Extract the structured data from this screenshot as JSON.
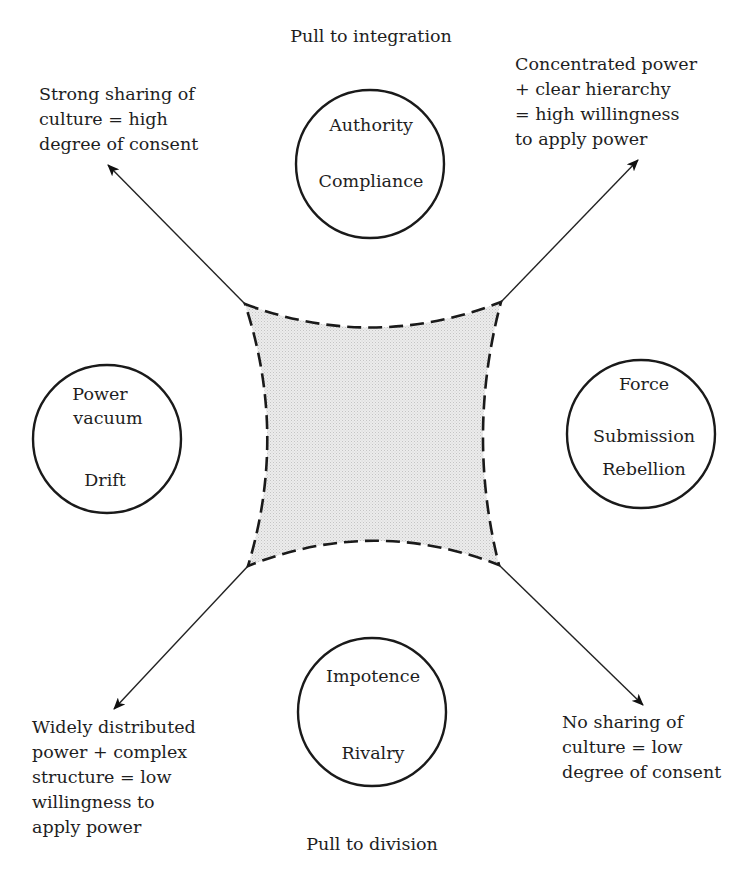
{
  "poles": {
    "top": "Pull to integration",
    "bottom": "Pull to division"
  },
  "circles": {
    "top": {
      "lines": [
        "Authority",
        "Compliance"
      ]
    },
    "left": {
      "lines": [
        "Power",
        "vacuum",
        "Drift"
      ]
    },
    "right": {
      "lines": [
        "Force",
        "Submission",
        "Rebellion"
      ]
    },
    "bottom": {
      "lines": [
        "Impotence",
        "Rivalry"
      ]
    }
  },
  "corner_labels": {
    "top_left": [
      "Strong sharing of",
      "culture = high",
      "degree of consent"
    ],
    "top_right": [
      "Concentrated power",
      "+ clear hierarchy",
      "= high willingness",
      "to apply power"
    ],
    "bottom_left": [
      "Widely distributed",
      "power + complex",
      "structure = low",
      "willingness to",
      "apply power"
    ],
    "bottom_right": [
      "No sharing of",
      "culture = low",
      "degree of consent"
    ]
  },
  "colors": {
    "ink": "#1a1a1a",
    "shaded_region": "#e8e8e8",
    "background": "#ffffff"
  }
}
